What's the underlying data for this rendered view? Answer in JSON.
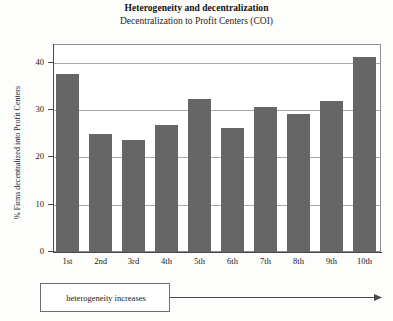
{
  "chart_data": {
    "type": "bar",
    "title": "Heterogeneity and decentralization",
    "subtitle": "Decentralization to Profit Centers (COI)",
    "xlabel": "",
    "ylabel": "% Firms decentralized into Profit Centers",
    "categories": [
      "1st",
      "2nd",
      "3rd",
      "4th",
      "5th",
      "6th",
      "7th",
      "8th",
      "9th",
      "10th"
    ],
    "values": [
      37.6,
      25.0,
      23.8,
      26.8,
      32.3,
      26.3,
      30.6,
      29.1,
      31.9,
      41.2
    ],
    "ylim": [
      0,
      44
    ],
    "yticks": [
      0,
      10,
      20,
      30,
      40
    ],
    "ytick_labels": [
      "0",
      "10",
      "20",
      "30",
      "40"
    ],
    "grid": true,
    "grid_axis": "y",
    "legend": false,
    "bar_color": "#666666",
    "frame_color": "#8d8d8d",
    "grid_color": "#a9a9a9",
    "annotation": {
      "label": "heterogeneity increases",
      "arrow_direction": "right"
    }
  }
}
